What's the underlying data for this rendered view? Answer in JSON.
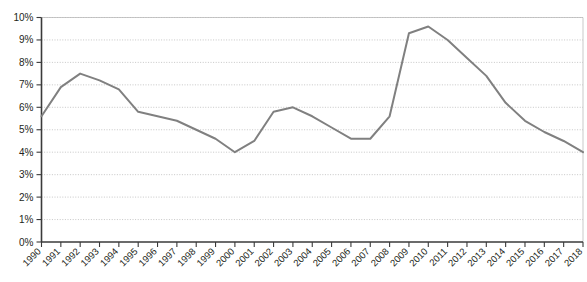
{
  "chart_data": {
    "type": "line",
    "title": "",
    "subtitle": "",
    "xlabel": "",
    "ylabel": "",
    "categories": [
      "1990",
      "1991",
      "1992",
      "1993",
      "1994",
      "1995",
      "1996",
      "1997",
      "1998",
      "1999",
      "2000",
      "2001",
      "2002",
      "2003",
      "2004",
      "2005",
      "2006",
      "2007",
      "2008",
      "2009",
      "2010",
      "2011",
      "2012",
      "2013",
      "2014",
      "2015",
      "2016",
      "2017",
      "2018"
    ],
    "values": [
      5.6,
      6.9,
      7.5,
      7.2,
      6.8,
      5.8,
      5.6,
      5.4,
      5.0,
      4.6,
      4.0,
      4.5,
      5.8,
      6.0,
      5.6,
      5.1,
      4.6,
      4.6,
      5.6,
      9.3,
      9.6,
      9.0,
      8.2,
      7.4,
      6.2,
      5.4,
      4.9,
      4.5,
      4.0
    ],
    "unit": "%",
    "value_labels": [
      "5.6%",
      "6.9%",
      "7.5%",
      "7.2%",
      "6.8%",
      "5.8%",
      "5.6%",
      "5.4%",
      "5.0%",
      "4.6%",
      "4.0%",
      "4.5%",
      "5.8%",
      "6.0%",
      "5.6%",
      "5.1%",
      "4.6%",
      "4.6%",
      "5.6%",
      "9.3%",
      "9.6%",
      "9.0%",
      "8.2%",
      "7.4%",
      "6.2%",
      "5.4%",
      "4.9%",
      "4.5%",
      "4.0%"
    ],
    "ylim": [
      0,
      10
    ],
    "ytick_values": [
      0,
      1,
      2,
      3,
      4,
      5,
      6,
      7,
      8,
      9,
      10
    ],
    "ytick_labels": [
      "0%",
      "1%",
      "2%",
      "3%",
      "4%",
      "5%",
      "6%",
      "7%",
      "8%",
      "9%",
      "10%"
    ],
    "grid": true,
    "grid_axis": "y",
    "legend": false,
    "legend_position": "none",
    "series": [
      {
        "name": "",
        "color": "#808080",
        "values": [
          5.6,
          6.9,
          7.5,
          7.2,
          6.8,
          5.8,
          5.6,
          5.4,
          5.0,
          4.6,
          4.0,
          4.5,
          5.8,
          6.0,
          5.6,
          5.1,
          4.6,
          4.6,
          5.6,
          9.3,
          9.6,
          9.0,
          8.2,
          7.4,
          6.2,
          5.4,
          4.9,
          4.5,
          4.0
        ]
      }
    ],
    "colors": {
      "line": "#808080",
      "grid": "#b9b9b9",
      "axis": "#3a3a3a",
      "text": "#231f20",
      "background": "#ffffff"
    },
    "xtick_rotation": -45
  }
}
